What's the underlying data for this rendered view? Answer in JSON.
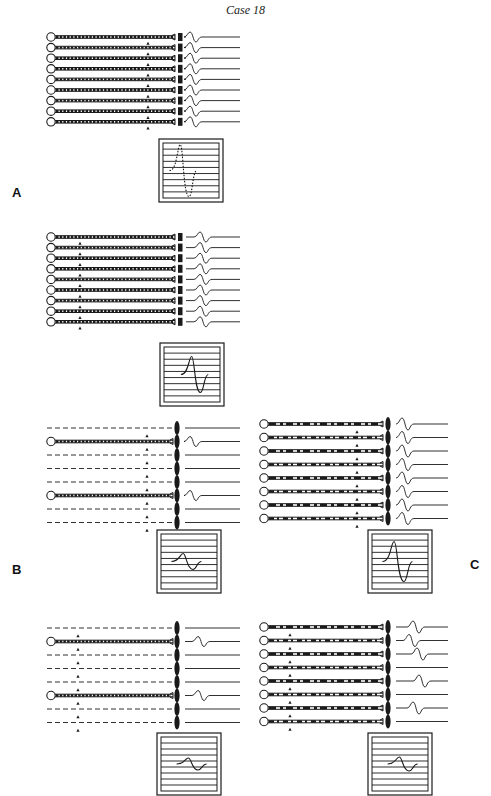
{
  "title": "Case 18",
  "labels": {
    "A": {
      "text": "A",
      "x": 12,
      "y": 193
    },
    "B": {
      "text": "B",
      "x": 12,
      "y": 570
    },
    "C": {
      "text": "C",
      "x": 470,
      "y": 565
    }
  },
  "groups": [
    {
      "id": "A",
      "x0": 47,
      "y0": 37,
      "rowGap": 10.6,
      "rows": 9,
      "fiberEnd": 175,
      "junction": "block",
      "junctionX": 178,
      "fiberStyle": "dense",
      "arrowX": 148,
      "arrowRows": [
        1,
        2,
        3,
        4,
        5,
        6,
        7,
        8,
        9
      ],
      "fibers": [
        1,
        1,
        1,
        1,
        1,
        1,
        1,
        1,
        1
      ],
      "waves": [
        1,
        1,
        1,
        1,
        1,
        1,
        1,
        1,
        1
      ],
      "waveX": 190,
      "waveAmp": 5,
      "lineEnd": 240,
      "scope": {
        "x": 159,
        "y": 139,
        "w": 64,
        "h": 63,
        "trace": "dotted",
        "amp": 26,
        "cx": 0.35,
        "width": 0.45
      }
    },
    {
      "id": "A2",
      "x0": 47,
      "y0": 237,
      "rowGap": 10.6,
      "rows": 9,
      "fiberEnd": 175,
      "junction": "block",
      "junctionX": 178,
      "fiberStyle": "dense",
      "arrowX": 80,
      "arrowRows": [
        1,
        2,
        3,
        4,
        5,
        6,
        7,
        8,
        9
      ],
      "fibers": [
        1,
        1,
        1,
        1,
        1,
        1,
        1,
        1,
        1
      ],
      "waves": [
        1,
        1,
        1,
        1,
        1,
        1,
        1,
        1,
        1
      ],
      "waveX": 200,
      "waveAmp": 5,
      "lineEnd": 240,
      "scope": {
        "x": 160,
        "y": 343,
        "w": 64,
        "h": 63,
        "trace": "solid",
        "amp": 18,
        "cx": 0.55,
        "width": 0.45
      }
    },
    {
      "id": "B1",
      "x0": 47,
      "y0": 428,
      "rowGap": 13.5,
      "rows": 8,
      "fiberEnd": 173,
      "junction": "oval",
      "junctionX": 177,
      "fiberStyle": "dense",
      "arrowX": 147,
      "arrowRows": [
        1,
        2,
        3,
        4,
        5,
        6,
        7,
        8,
        9
      ],
      "fibers": [
        0,
        1,
        0,
        0,
        0,
        1,
        0,
        0
      ],
      "waves": [
        0,
        1,
        0,
        0,
        0,
        1,
        0,
        0
      ],
      "waveX": 190,
      "waveAmp": 5,
      "lineEnd": 240,
      "scope": {
        "x": 157,
        "y": 530,
        "w": 64,
        "h": 63,
        "trace": "solid",
        "amp": 8,
        "cx": 0.45,
        "width": 0.5
      }
    },
    {
      "id": "C1",
      "x0": 260,
      "y0": 424,
      "rowGap": 13.5,
      "rows": 8,
      "fiberEnd": 383,
      "junction": "oval",
      "junctionX": 388,
      "fiberStyle": "sparse",
      "arrowX": 357,
      "arrowRows": [
        1,
        2,
        3,
        4,
        5,
        6,
        7,
        8,
        9
      ],
      "fibers": [
        1,
        1,
        1,
        1,
        1,
        1,
        1,
        1
      ],
      "waves": [
        1,
        1,
        1,
        1,
        1,
        1,
        1,
        1
      ],
      "waveX": 402,
      "waveAmp": 6,
      "lineEnd": 448,
      "scope": {
        "x": 368,
        "y": 530,
        "w": 64,
        "h": 63,
        "trace": "solid",
        "amp": 20,
        "cx": 0.45,
        "width": 0.5
      }
    },
    {
      "id": "B2",
      "x0": 47,
      "y0": 628,
      "rowGap": 13.5,
      "rows": 8,
      "fiberEnd": 173,
      "junction": "oval",
      "junctionX": 177,
      "fiberStyle": "dense",
      "arrowX": 78,
      "arrowRows": [
        1,
        2,
        3,
        4,
        5,
        6,
        7,
        8,
        9
      ],
      "fibers": [
        0,
        1,
        0,
        0,
        0,
        1,
        0,
        0
      ],
      "waves": [
        0,
        1,
        0,
        0,
        0,
        1,
        0,
        0
      ],
      "waveX": 198,
      "waveAmp": 5,
      "lineEnd": 240,
      "scope": {
        "x": 157,
        "y": 733,
        "w": 64,
        "h": 62,
        "trace": "solid",
        "amp": 6,
        "cx": 0.55,
        "width": 0.5
      }
    },
    {
      "id": "C2",
      "x0": 260,
      "y0": 627,
      "rowGap": 13.5,
      "rows": 8,
      "fiberEnd": 383,
      "junction": "oval",
      "junctionX": 388,
      "fiberStyle": "sparse",
      "arrowX": 290,
      "arrowRows": [
        1,
        2,
        3,
        4,
        5,
        6,
        7,
        8,
        9
      ],
      "fibers": [
        1,
        1,
        1,
        1,
        1,
        1,
        1,
        1
      ],
      "waves": [
        1,
        1,
        1,
        0,
        1,
        0,
        1,
        0
      ],
      "waveShift": [
        0,
        -4,
        4,
        0,
        6,
        0,
        0,
        0
      ],
      "waveX": 413,
      "waveAmp": 6,
      "lineEnd": 448,
      "scope": {
        "x": 368,
        "y": 733,
        "w": 64,
        "h": 62,
        "trace": "solid",
        "amp": 7,
        "cx": 0.55,
        "width": 0.5
      }
    }
  ]
}
